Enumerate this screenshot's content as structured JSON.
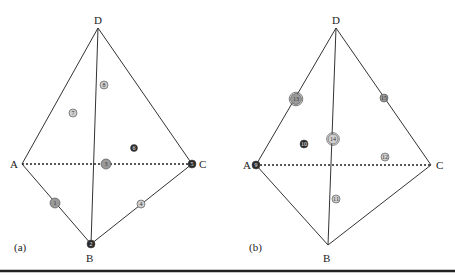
{
  "colors": {
    "edge": "#333333",
    "marker_light": "#cfcfcf",
    "marker_mid": "#9a9a9a",
    "marker_dark": "#2a2a2a",
    "bottom_rule": "#222222"
  },
  "panels": [
    {
      "id": "a",
      "caption": "(a)",
      "vertices": [
        {
          "name": "D",
          "x": 98,
          "y": 28,
          "label": "D",
          "lx": 94,
          "ly": 24
        },
        {
          "name": "A",
          "x": 22,
          "y": 164,
          "label": "A",
          "lx": 10,
          "ly": 168
        },
        {
          "name": "C",
          "x": 192,
          "y": 164,
          "label": "C",
          "lx": 199,
          "ly": 168
        },
        {
          "name": "B",
          "x": 91,
          "y": 244,
          "label": "B",
          "lx": 86,
          "ly": 262
        }
      ],
      "markers": [
        {
          "num": "1",
          "x": 55,
          "y": 203,
          "r": 5,
          "shade": "mid"
        },
        {
          "num": "2",
          "x": 91,
          "y": 244,
          "r": 4,
          "shade": "dark"
        },
        {
          "num": "3",
          "x": 106,
          "y": 164,
          "r": 5,
          "shade": "mid"
        },
        {
          "num": "4",
          "x": 141,
          "y": 204,
          "r": 4,
          "shade": "light"
        },
        {
          "num": "5",
          "x": 192,
          "y": 164,
          "r": 4,
          "shade": "dark"
        },
        {
          "num": "6",
          "x": 134,
          "y": 148,
          "r": 3.5,
          "shade": "dark"
        },
        {
          "num": "7",
          "x": 73,
          "y": 113,
          "r": 4,
          "shade": "light"
        },
        {
          "num": "8",
          "x": 104,
          "y": 85,
          "r": 4,
          "shade": "light"
        }
      ]
    },
    {
      "id": "b",
      "caption": "(b)",
      "vertices": [
        {
          "name": "D",
          "x": 336,
          "y": 28,
          "label": "D",
          "lx": 332,
          "ly": 24
        },
        {
          "name": "A",
          "x": 256,
          "y": 165,
          "label": "A",
          "lx": 243,
          "ly": 169
        },
        {
          "name": "C",
          "x": 431,
          "y": 165,
          "label": "C",
          "lx": 436,
          "ly": 169
        },
        {
          "name": "B",
          "x": 328,
          "y": 245,
          "label": "B",
          "lx": 323,
          "ly": 262
        }
      ],
      "markers": [
        {
          "num": "9",
          "x": 256,
          "y": 165,
          "r": 4,
          "shade": "dark"
        },
        {
          "num": "10",
          "x": 304,
          "y": 144,
          "r": 4,
          "shade": "dark"
        },
        {
          "num": "11",
          "x": 336,
          "y": 199,
          "r": 4,
          "shade": "light"
        },
        {
          "num": "12",
          "x": 385,
          "y": 157,
          "r": 4,
          "shade": "light"
        },
        {
          "num": "13",
          "x": 296,
          "y": 99,
          "r": 5.5,
          "shade": "mid",
          "ring": true
        },
        {
          "num": "14",
          "x": 333,
          "y": 139,
          "r": 5,
          "shade": "light",
          "ring": true
        },
        {
          "num": "15",
          "x": 384,
          "y": 98,
          "r": 4,
          "shade": "mid"
        }
      ]
    }
  ],
  "bottom_rule": {
    "y": 271
  }
}
